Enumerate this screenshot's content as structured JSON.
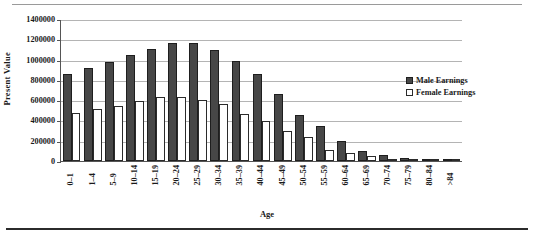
{
  "figure": {
    "y_axis_title": "Present Value",
    "x_axis_title": "Age"
  },
  "legend": {
    "position": "right",
    "entries": [
      {
        "label": "Male Earnings",
        "color": "#474747",
        "name": "male-earnings"
      },
      {
        "label": "Female Earnings",
        "color": "#ffffff",
        "name": "female-earnings"
      }
    ]
  },
  "chart_data": {
    "type": "bar",
    "title": "",
    "subtitle": "",
    "xlabel": "Age",
    "ylabel": "Present Value",
    "ylim": [
      0,
      1400000
    ],
    "ytick_labels": [
      "1400000",
      "1200000",
      "1000000",
      "800000",
      "600000",
      "400000",
      "200000",
      "0"
    ],
    "yticks": [
      1400000,
      1200000,
      1000000,
      800000,
      600000,
      400000,
      200000,
      0
    ],
    "grid": true,
    "legend_position": "right",
    "categories": [
      "0–1",
      "1–4",
      "5–9",
      "10–14",
      "15–19",
      "20–24",
      "25–29",
      "30–34",
      "35–39",
      "40–44",
      "45–49",
      "50–54",
      "55–59",
      "60–64",
      "65–69",
      "70–74",
      "75–79",
      "80–84",
      ">84"
    ],
    "series": [
      {
        "name": "Male Earnings",
        "color": "#474747",
        "values": [
          865000,
          920000,
          985000,
          1055000,
          1110000,
          1175000,
          1170000,
          1105000,
          990000,
          860000,
          670000,
          460000,
          345000,
          195000,
          100000,
          55000,
          30000,
          18000,
          10000
        ]
      },
      {
        "name": "Female Earnings",
        "color": "#ffffff",
        "values": [
          480000,
          512000,
          548000,
          600000,
          640000,
          640000,
          610000,
          570000,
          470000,
          400000,
          300000,
          235000,
          105000,
          80000,
          50000,
          18000,
          12000,
          8000,
          6000
        ]
      }
    ]
  }
}
